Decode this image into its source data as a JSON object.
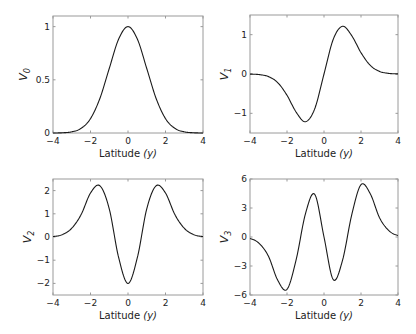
{
  "chart_data": [
    {
      "type": "line",
      "panel": "top-left",
      "ylabel": "V",
      "ylabel_sub": "0",
      "xlabel": "Latitude ",
      "xlabel_var": "(y)",
      "xlim": [
        -4,
        4
      ],
      "ylim": [
        0,
        1.1
      ],
      "xticks": [
        -4,
        -2,
        0,
        2,
        4
      ],
      "xtick_labels": [
        "−4",
        "−2",
        "0",
        "2",
        "4"
      ],
      "yticks": [
        0,
        0.5,
        1
      ],
      "ytick_labels": [
        "0",
        "0.5",
        "1"
      ],
      "box": [
        53,
        16,
        203,
        133
      ],
      "x": [
        -4,
        -3.5,
        -3,
        -2.5,
        -2,
        -1.5,
        -1,
        -0.5,
        0,
        0.5,
        1,
        1.5,
        2,
        2.5,
        3,
        3.5,
        4
      ],
      "y": [
        0.0003,
        0.0022,
        0.0111,
        0.0439,
        0.1353,
        0.3247,
        0.6065,
        0.8825,
        1.0,
        0.8825,
        0.6065,
        0.3247,
        0.1353,
        0.0439,
        0.0111,
        0.0022,
        0.0003
      ]
    },
    {
      "type": "line",
      "panel": "top-right",
      "ylabel": "V",
      "ylabel_sub": "1",
      "xlabel": "Latitude ",
      "xlabel_var": "(y)",
      "xlim": [
        -4,
        4
      ],
      "ylim": [
        -1.5,
        1.5
      ],
      "xticks": [
        -4,
        -2,
        0,
        2,
        4
      ],
      "xtick_labels": [
        "−4",
        "−2",
        "0",
        "2",
        "4"
      ],
      "yticks": [
        -1,
        0,
        1
      ],
      "ytick_labels": [
        "−1",
        "0",
        "1"
      ],
      "box": [
        250,
        15,
        398,
        133
      ],
      "x": [
        -4,
        -3.5,
        -3,
        -2.5,
        -2,
        -1.5,
        -1,
        -0.5,
        0,
        0.5,
        1,
        1.5,
        2,
        2.5,
        3,
        3.5,
        4
      ],
      "y": [
        -0.0027,
        -0.0153,
        -0.0666,
        -0.2196,
        -0.5413,
        -0.974,
        -1.2131,
        -0.8825,
        0,
        0.8825,
        1.2131,
        0.974,
        0.5413,
        0.2196,
        0.0666,
        0.0153,
        0.0027
      ]
    },
    {
      "type": "line",
      "panel": "bottom-left",
      "ylabel": "V",
      "ylabel_sub": "2",
      "xlabel": "Latitude ",
      "xlabel_var": "(y)",
      "xlim": [
        -4,
        4
      ],
      "ylim": [
        -2.5,
        2.5
      ],
      "xticks": [
        -4,
        -2,
        0,
        2,
        4
      ],
      "xtick_labels": [
        "−4",
        "−2",
        "0",
        "2",
        "4"
      ],
      "yticks": [
        -2,
        -1,
        0,
        1,
        2
      ],
      "ytick_labels": [
        "−2",
        "−1",
        "0",
        "1",
        "2"
      ],
      "box": [
        53,
        179,
        203,
        295
      ],
      "x": [
        -4,
        -3.5,
        -3,
        -2.5,
        -2,
        -1.5,
        -1,
        -0.5,
        0,
        0.5,
        1,
        1.5,
        2,
        2.5,
        3,
        3.5,
        4
      ],
      "y": [
        0.0208,
        0.1033,
        0.3776,
        0.9659,
        1.8947,
        2.2079,
        1.2131,
        -0.8825,
        -2.0,
        -0.8825,
        1.2131,
        2.2079,
        1.8947,
        0.9659,
        0.3776,
        0.1033,
        0.0208
      ]
    },
    {
      "type": "line",
      "panel": "bottom-right",
      "ylabel": "V",
      "ylabel_sub": "3",
      "xlabel": "Latitude ",
      "xlabel_var": "(y)",
      "xlim": [
        -4,
        4
      ],
      "ylim": [
        -6,
        6
      ],
      "xticks": [
        -4,
        -2,
        0,
        2,
        4
      ],
      "xtick_labels": [
        "−4",
        "−2",
        "0",
        "2",
        "4"
      ],
      "yticks": [
        -6,
        -3,
        0,
        3,
        6
      ],
      "ytick_labels": [
        "−6",
        "−3",
        "0",
        "3",
        "6"
      ],
      "box": [
        250,
        179,
        398,
        295
      ],
      "x": [
        -4,
        -3.5,
        -3,
        -2.5,
        -2,
        -1.5,
        -1,
        -0.5,
        0,
        0.5,
        1,
        1.5,
        2,
        2.5,
        3,
        3.5,
        4
      ],
      "y": [
        -0.1526,
        -0.669,
        -2.0,
        -4.4803,
        -5.4134,
        -2.3052,
        2.4261,
        4.4126,
        0,
        -4.4126,
        -2.4261,
        2.3052,
        5.4134,
        4.4803,
        2.0,
        0.669,
        0.1526
      ]
    }
  ]
}
